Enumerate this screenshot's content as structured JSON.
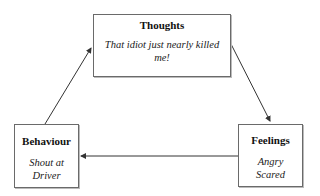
{
  "diagram": {
    "type": "cycle",
    "nodes": [
      {
        "id": "thoughts",
        "title": "Thoughts",
        "text_line1": "That idiot just nearly killed",
        "text_line2": "me!"
      },
      {
        "id": "feelings",
        "title": "Feelings",
        "text_line1": "Angry",
        "text_line2": "Scared"
      },
      {
        "id": "behaviour",
        "title": "Behaviour",
        "text_line1": "Shout at",
        "text_line2": "Driver"
      }
    ],
    "edges": [
      {
        "from": "thoughts",
        "to": "feelings"
      },
      {
        "from": "feelings",
        "to": "behaviour"
      },
      {
        "from": "behaviour",
        "to": "thoughts"
      }
    ],
    "colors": {
      "border": "#6a6a6a",
      "arrow": "#333333",
      "background": "#ffffff"
    }
  }
}
